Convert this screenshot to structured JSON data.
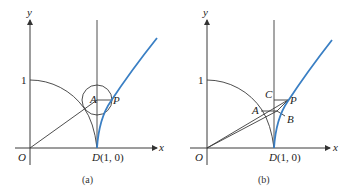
{
  "panels": [
    {
      "id": "a",
      "caption": "(a)",
      "axis_x_label": "x",
      "axis_y_label": "y",
      "origin_label": "O",
      "tick_y_label": "1",
      "point_D_label": "D",
      "point_D_coords": "(1, 0)",
      "point_A_label": "A",
      "point_P_label": "P"
    },
    {
      "id": "b",
      "caption": "(b)",
      "axis_x_label": "x",
      "axis_y_label": "y",
      "origin_label": "O",
      "tick_y_label": "1",
      "point_D_label": "D",
      "point_D_coords": "(1, 0)",
      "point_A_label": "A",
      "point_B_label": "B",
      "point_C_label": "C",
      "point_P_label": "P"
    }
  ],
  "colors": {
    "curve": "#3a7fc4",
    "lines": "#3a3a3a"
  }
}
